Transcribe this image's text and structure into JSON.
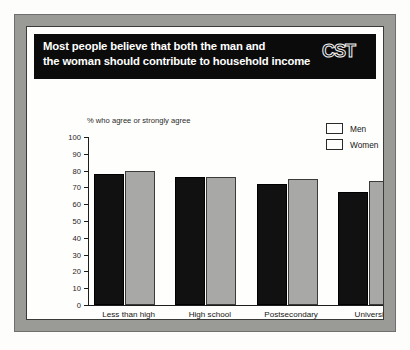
{
  "banner": {
    "title": "Most people believe that both the man and\nthe woman should contribute to household income",
    "logo_text": "CST"
  },
  "chart_data": {
    "type": "bar",
    "title": "Most people believe that both the man and the woman should contribute to household income",
    "categories": [
      "Less than high\nschool",
      "High school\ndiploma",
      "Postsecondary\n(other than university)",
      "University"
    ],
    "series": [
      {
        "name": "Men",
        "color": "#111111",
        "values": [
          78,
          76,
          72,
          67
        ]
      },
      {
        "name": "Women",
        "color": "#a8a8a6",
        "values": [
          80,
          76,
          75,
          74
        ]
      }
    ],
    "xlabel": "",
    "ylabel": "% who agree or strongly agree",
    "ylim": [
      0,
      100
    ],
    "yticks": [
      0,
      10,
      20,
      30,
      40,
      50,
      60,
      70,
      80,
      90,
      100
    ],
    "grid": false,
    "legend_position": "top-right",
    "source": "Source: Statistics Canada, 1995 General Social Survey."
  }
}
